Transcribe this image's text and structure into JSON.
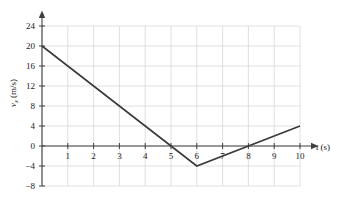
{
  "chart_data": {
    "type": "line",
    "title": "",
    "xlabel": "t (s)",
    "ylabel": "v_x (m/s)",
    "xlabel_symbol": "t",
    "xlabel_unit": "(s)",
    "ylabel_symbol": "v",
    "ylabel_subscript": "x",
    "ylabel_unit": "(m/s)",
    "xlim": [
      0,
      10
    ],
    "ylim": [
      -8,
      24
    ],
    "xticks": [
      1,
      2,
      3,
      4,
      5,
      6,
      7,
      8,
      9,
      10
    ],
    "xticklabels": [
      "1",
      "2",
      "3",
      "4",
      "5",
      "6",
      "7",
      "8",
      "9",
      "10"
    ],
    "yticks": [
      -8,
      -4,
      0,
      4,
      8,
      12,
      16,
      20,
      24
    ],
    "yticklabels": [
      "-8",
      "-4",
      "0",
      "4",
      "8",
      "12",
      "16",
      "20",
      "24"
    ],
    "grid": true,
    "grid_color": "#d8d8d8",
    "axis_color": "#404040",
    "line_color": "#3a3a3a",
    "legend": "none",
    "series": [
      {
        "name": "velocity",
        "x": [
          0,
          5,
          6,
          10
        ],
        "values": [
          20,
          0,
          -4,
          4
        ]
      }
    ],
    "annotations": [
      {
        "label": "start",
        "x": 0,
        "y": 20
      },
      {
        "label": "zero-crossing",
        "x": 5,
        "y": 0
      },
      {
        "label": "minimum",
        "x": 6,
        "y": -4
      },
      {
        "label": "zero-crossing-2",
        "x": 8,
        "y": 0
      },
      {
        "label": "end",
        "x": 10,
        "y": 4
      }
    ]
  }
}
